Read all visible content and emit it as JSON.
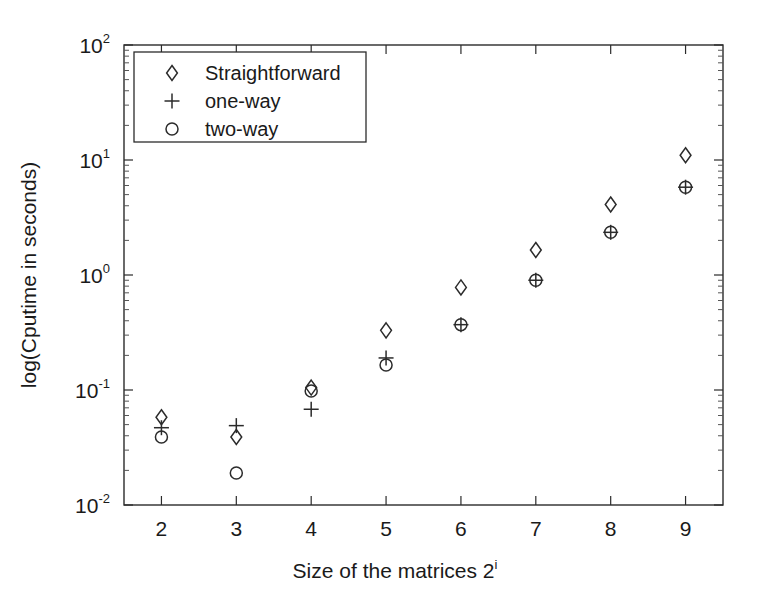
{
  "chart_data": {
    "type": "scatter",
    "title": "",
    "xlabel": "Size of the matrices 2",
    "xlabel_sup": "i",
    "ylabel": "log(Cputime in seconds)",
    "yscale": "log",
    "xscale": "linear",
    "xlim": [
      1.5,
      9.5
    ],
    "ylim": [
      0.01,
      100
    ],
    "x_ticks": [
      "2",
      "3",
      "4",
      "5",
      "6",
      "7",
      "8",
      "9"
    ],
    "x_tick_values": [
      2,
      3,
      4,
      5,
      6,
      7,
      8,
      9
    ],
    "y_ticks": [
      {
        "base": "10",
        "exp": "2",
        "value": 100
      },
      {
        "base": "10",
        "exp": "1",
        "value": 10
      },
      {
        "base": "10",
        "exp": "0",
        "value": 1
      },
      {
        "base": "10",
        "exp": "-1",
        "value": 0.1
      },
      {
        "base": "10",
        "exp": "-2",
        "value": 0.01
      }
    ],
    "grid": false,
    "legend_position": "upper-left-inside",
    "x": [
      2,
      3,
      4,
      5,
      6,
      7,
      8,
      9
    ],
    "series": [
      {
        "name": "Straightforward",
        "marker": "diamond",
        "values": [
          0.058,
          0.039,
          0.105,
          0.33,
          0.78,
          1.65,
          4.1,
          11.0
        ]
      },
      {
        "name": "one-way",
        "marker": "plus",
        "values": [
          0.047,
          0.049,
          0.068,
          0.19,
          0.37,
          0.9,
          2.35,
          5.8
        ]
      },
      {
        "name": "two-way",
        "marker": "circle",
        "values": [
          0.039,
          0.019,
          0.098,
          0.165,
          0.37,
          0.9,
          2.35,
          5.8
        ]
      }
    ]
  },
  "legend": {
    "entries": [
      {
        "label": "Straightforward",
        "marker": "diamond"
      },
      {
        "label": "one-way",
        "marker": "plus"
      },
      {
        "label": "two-way",
        "marker": "circle"
      }
    ]
  },
  "axes": {
    "x_title": "Size of the matrices 2",
    "x_title_sup": "i",
    "y_title": "log(Cputime in seconds)"
  },
  "colors": {
    "marker": "#2b2b2b",
    "frame": "#2b2b2b",
    "background": "#ffffff"
  }
}
